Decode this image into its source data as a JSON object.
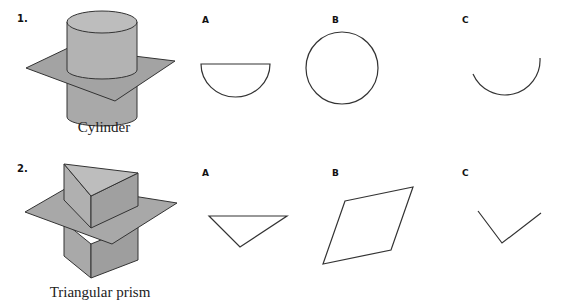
{
  "problems": [
    {
      "number": "1.",
      "solid": "Cylinder",
      "options": [
        {
          "label": "A",
          "shape": "semicircle"
        },
        {
          "label": "B",
          "shape": "circle"
        },
        {
          "label": "C",
          "shape": "arc"
        }
      ]
    },
    {
      "number": "2.",
      "solid": "Triangular prism",
      "options": [
        {
          "label": "A",
          "shape": "triangle"
        },
        {
          "label": "B",
          "shape": "parallelogram"
        },
        {
          "label": "C",
          "shape": "angle"
        }
      ]
    }
  ],
  "colors": {
    "solid_fill": "#b0b0b0",
    "solid_dark": "#9a9a9a",
    "plane_fill": "#a8a8a8",
    "stroke": "#333333"
  }
}
